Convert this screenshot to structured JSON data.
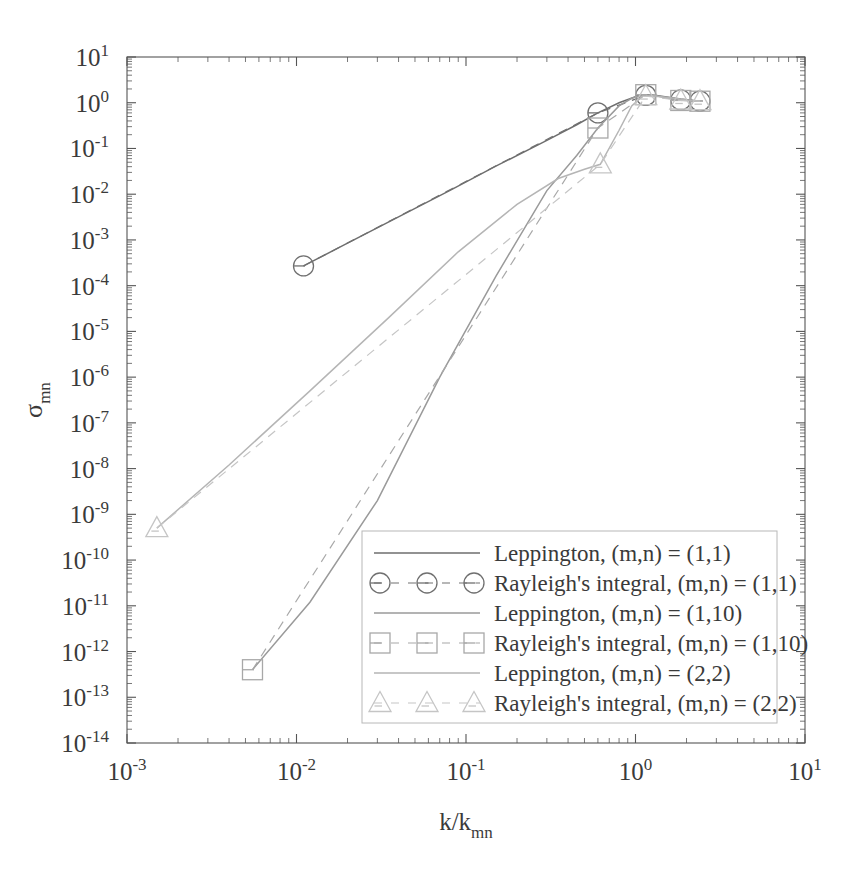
{
  "figure": {
    "background": "#ffffff",
    "axis_color": "#555555",
    "text_color": "#3a3a3a"
  },
  "axes": {
    "x_label": "k/k",
    "x_label_sub": "mn",
    "y_label": "σ",
    "y_label_sub": "mn",
    "x_ticks": [
      "10-3",
      "10-2",
      "10-1",
      "100",
      "101"
    ],
    "x_tick_mantissa": "10",
    "x_tick_exponents": [
      "-3",
      "-2",
      "-1",
      "0",
      "1"
    ],
    "y_tick_exponents": [
      "1",
      "0",
      "-1",
      "-2",
      "-3",
      "-4",
      "-5",
      "-6",
      "-7",
      "-8",
      "-9",
      "-10",
      "-11",
      "-12",
      "-13",
      "-14"
    ],
    "minor_ticks": true,
    "frame": true
  },
  "legend": {
    "border_color": "#b8b8b8",
    "background": "#ffffff",
    "entries": [
      {
        "label": "Leppington, (m,n) = (1,1)",
        "style": "line",
        "marker": "none",
        "color": "#6e6e6e"
      },
      {
        "label": "Rayleigh's integral, (m,n) = (1,1)",
        "style": "dashed",
        "marker": "circle",
        "color": "#707070"
      },
      {
        "label": "Leppington, (m,n) = (1,10)",
        "style": "line",
        "marker": "none",
        "color": "#9a9a9a"
      },
      {
        "label": "Rayleigh's integral, (m,n) = (1,10)",
        "style": "dashed",
        "marker": "square",
        "color": "#a8a8a8"
      },
      {
        "label": "Leppington, (m,n) = (2,2)",
        "style": "line",
        "marker": "none",
        "color": "#b5b5b5"
      },
      {
        "label": "Rayleigh's integral, (m,n) = (2,2)",
        "style": "dashed",
        "marker": "triangle",
        "color": "#c5c5c5"
      }
    ]
  },
  "chart_data": {
    "type": "line",
    "title": "",
    "xlabel": "k/k_mn",
    "ylabel": "sigma_mn",
    "xscale": "log",
    "yscale": "log",
    "xlim": [
      0.001,
      10
    ],
    "ylim": [
      1e-14,
      10
    ],
    "grid": false,
    "legend_position": "lower-right",
    "series": [
      {
        "name": "Leppington, (m,n) = (1,1)",
        "marker": "none",
        "linestyle": "solid",
        "color": "#6e6e6e",
        "x": [
          0.011,
          0.02,
          0.04,
          0.08,
          0.15,
          0.3,
          0.45,
          0.6,
          0.8,
          1.0,
          1.15,
          1.3,
          1.6,
          1.85,
          2.2,
          2.5
        ],
        "y": [
          0.00027,
          0.00085,
          0.0032,
          0.012,
          0.041,
          0.15,
          0.33,
          0.6,
          1.0,
          1.35,
          1.5,
          1.45,
          1.3,
          1.2,
          1.12,
          1.08
        ]
      },
      {
        "name": "Rayleigh's integral, (m,n) = (1,1)",
        "marker": "circle",
        "linestyle": "dashed",
        "color": "#707070",
        "x": [
          0.011,
          0.6,
          1.15,
          1.85,
          2.4
        ],
        "y": [
          0.00027,
          0.6,
          1.45,
          1.15,
          1.08
        ]
      },
      {
        "name": "Leppington, (m,n) = (1,10)",
        "marker": "none",
        "linestyle": "solid",
        "color": "#9a9a9a",
        "x": [
          0.0055,
          0.012,
          0.03,
          0.07,
          0.15,
          0.3,
          0.45,
          0.6,
          0.8,
          0.95,
          1.1,
          1.25,
          1.6,
          1.9,
          2.3,
          2.5
        ],
        "y": [
          4e-13,
          1.2e-11,
          2e-09,
          1e-06,
          0.00016,
          0.012,
          0.07,
          0.28,
          0.85,
          1.25,
          1.5,
          1.45,
          1.25,
          1.15,
          1.1,
          1.08
        ]
      },
      {
        "name": "Rayleigh's integral, (m,n) = (1,10)",
        "marker": "square",
        "linestyle": "dashed",
        "color": "#a8a8a8",
        "x": [
          0.0055,
          0.6,
          1.15,
          1.85,
          2.4
        ],
        "y": [
          4e-13,
          0.28,
          1.5,
          1.12,
          1.08
        ]
      },
      {
        "name": "Leppington, (m,n) = (2,2)",
        "marker": "none",
        "linestyle": "solid",
        "color": "#b5b5b5",
        "x": [
          0.0015,
          0.004,
          0.012,
          0.035,
          0.09,
          0.2,
          0.35,
          0.5,
          0.62,
          0.8,
          0.95,
          1.1,
          1.3,
          1.7,
          2.1,
          2.5
        ],
        "y": [
          5e-10,
          1.2e-08,
          5e-07,
          2e-05,
          0.00055,
          0.006,
          0.022,
          0.035,
          0.045,
          0.25,
          0.85,
          1.4,
          1.4,
          1.25,
          1.12,
          1.08
        ]
      },
      {
        "name": "Rayleigh's integral, (m,n) = (2,2)",
        "marker": "triangle",
        "linestyle": "dashed",
        "color": "#c5c5c5",
        "x": [
          0.0015,
          0.62,
          1.15,
          1.85,
          2.4
        ],
        "y": [
          5e-10,
          0.045,
          1.4,
          1.12,
          1.08
        ]
      }
    ]
  }
}
